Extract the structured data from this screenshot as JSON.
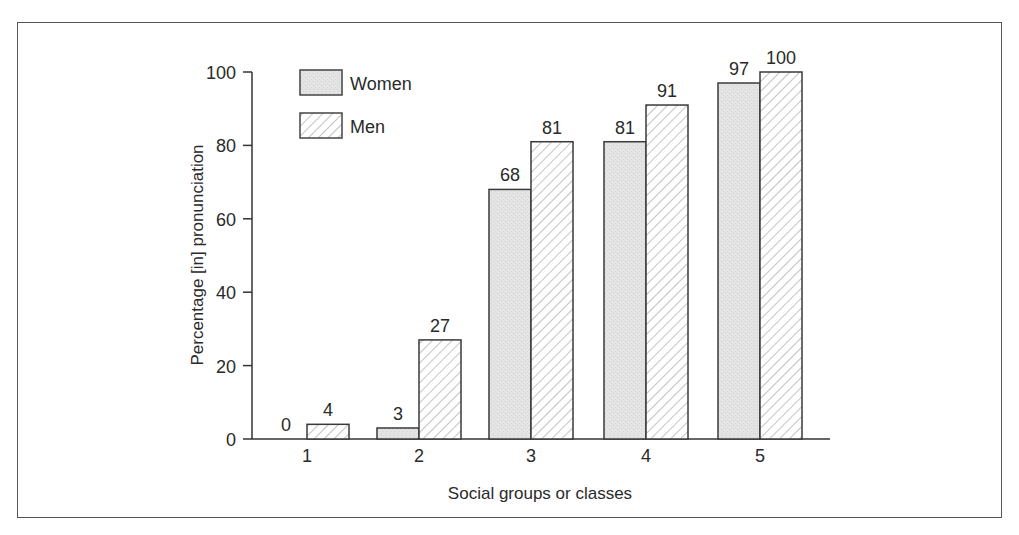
{
  "chart_data": {
    "type": "bar",
    "title": "",
    "xlabel": "Social groups or classes",
    "ylabel": "Percentage [in] pronunciation",
    "categories": [
      "1",
      "2",
      "3",
      "4",
      "5"
    ],
    "series": [
      {
        "name": "Women",
        "values": [
          0,
          3,
          68,
          81,
          97
        ],
        "fill": "#e3e3e3",
        "pattern": "stipple"
      },
      {
        "name": "Men",
        "values": [
          4,
          27,
          81,
          91,
          100
        ],
        "fill": "#ffffff",
        "pattern": "diagonal-hatch"
      }
    ],
    "ylim": [
      0,
      100
    ],
    "yticks": [
      0,
      20,
      40,
      60,
      80,
      100
    ],
    "grid": false,
    "legend_position": "upper-left",
    "data_labels": true
  }
}
